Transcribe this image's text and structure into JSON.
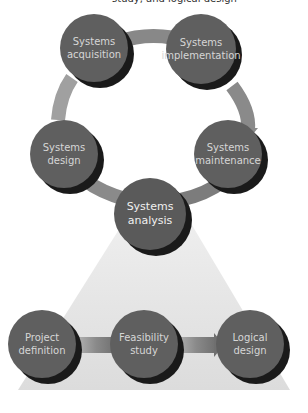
{
  "caption": "study, and logical design",
  "colors": {
    "node_fill": "#5f5f5f",
    "node_shadow": "#1a1a1a",
    "node_text": "#d6d6d6",
    "connector": "#8a8a8a",
    "funnel": "#e2e2e2",
    "background": "#ffffff"
  },
  "cycle": {
    "nodes": [
      {
        "id": "acquisition",
        "line1": "Systems",
        "line2": "acquisition"
      },
      {
        "id": "implementation",
        "line1": "Systems",
        "line2": "implementation"
      },
      {
        "id": "maintenance",
        "line1": "Systems",
        "line2": "maintenance"
      },
      {
        "id": "analysis",
        "line1": "Systems",
        "line2": "analysis"
      },
      {
        "id": "design",
        "line1": "Systems",
        "line2": "design"
      }
    ]
  },
  "detail": {
    "nodes": [
      {
        "id": "project",
        "line1": "Project",
        "line2": "definition"
      },
      {
        "id": "feasibility",
        "line1": "Feasibility",
        "line2": "study"
      },
      {
        "id": "logical",
        "line1": "Logical",
        "line2": "design"
      }
    ]
  }
}
